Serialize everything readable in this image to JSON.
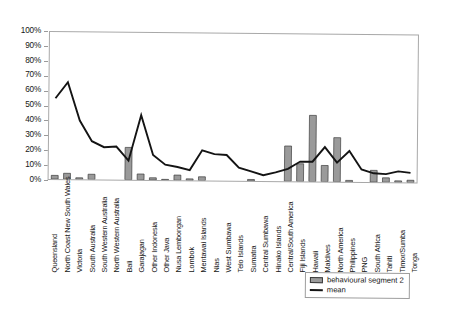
{
  "chart_data": {
    "type": "bar",
    "title": "",
    "subtitle": "",
    "xlabel": "",
    "ylabel": "",
    "ylim": [
      0,
      100
    ],
    "ytick_labels": [
      "0%",
      "10%",
      "20%",
      "30%",
      "40%",
      "50%",
      "60%",
      "70%",
      "80%",
      "90%",
      "100%"
    ],
    "ytick_values": [
      0,
      10,
      20,
      30,
      40,
      50,
      60,
      70,
      80,
      90,
      100
    ],
    "grid": false,
    "legend_position": "bottom-right",
    "categories": [
      "Queensland",
      "North Coast New South Wales",
      "Victoria",
      "South Australia",
      "South Western Australia",
      "North Western Australia",
      "Bali",
      "Garajagan",
      "Other Indonesia",
      "Other Java",
      "Nusa Lembongan",
      "Lombok",
      "Mentawai Islands",
      "Nias",
      "West Sumbawa",
      "Telo Islands",
      "Sumatra",
      "Central Sumbawa",
      "Hinako Islands",
      "Central/South America",
      "Fiji Islands",
      "Hawaii",
      "Maldives",
      "North America",
      "Philippines",
      "PNG",
      "South Africa",
      "Tahiti",
      "Timor/Sumba",
      "Tonga"
    ],
    "series": [
      {
        "name": "behavioural segment 2",
        "type": "bar",
        "values": [
          2.5,
          4.0,
          1.0,
          3.5,
          0.0,
          0.0,
          22.0,
          4.0,
          1.5,
          0.5,
          3.5,
          1.0,
          2.5,
          0.0,
          0.0,
          0.0,
          1.0,
          0.0,
          0.0,
          24.0,
          12.0,
          45.0,
          11.0,
          30.0,
          1.0,
          0.0,
          8.0,
          3.0,
          1.0,
          1.5
        ]
      },
      {
        "name": "mean",
        "type": "line",
        "values": [
          55.0,
          66.0,
          40.0,
          26.0,
          22.0,
          22.5,
          13.0,
          44.0,
          17.0,
          10.5,
          9.0,
          7.0,
          20.5,
          18.0,
          17.5,
          9.0,
          6.5,
          4.0,
          6.0,
          8.5,
          13.5,
          13.5,
          23.5,
          13.0,
          21.0,
          8.5,
          6.0,
          5.5,
          7.5,
          6.5
        ]
      }
    ],
    "legend": [
      {
        "label": "behavioural segment 2",
        "marker": "bar-swatch",
        "color": "#9a9a9a"
      },
      {
        "label": "mean",
        "marker": "line-swatch",
        "color": "#141414"
      }
    ],
    "colors": {
      "bar_fill": "#9a9a9a",
      "bar_stroke": "#3c3c3c",
      "line": "#141414",
      "axis": "#a8a8a8",
      "text": "#141414",
      "background": "#ffffff"
    }
  }
}
